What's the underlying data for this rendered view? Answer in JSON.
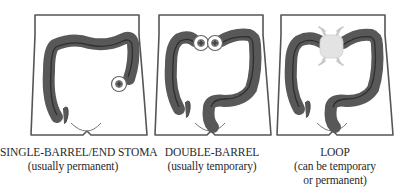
{
  "figure": {
    "panels": [
      {
        "id": "single-barrel",
        "title": "SINGLE-BARREL/END STOMA",
        "subtitle_lines": [
          "(usually permanent)"
        ],
        "stoma_count": 1
      },
      {
        "id": "double-barrel",
        "title": "DOUBLE-BARREL",
        "subtitle_lines": [
          "(usually temporary)"
        ],
        "stoma_count": 2
      },
      {
        "id": "loop",
        "title": "LOOP",
        "subtitle_lines": [
          "(can be temporary",
          "or permanent)"
        ],
        "stoma_count": 1
      }
    ],
    "colors": {
      "outline": "#555555",
      "colon_fill": "#555555",
      "colon_stripe": "#333333",
      "stoma_ring": "#666666",
      "stoma_center": "#777777",
      "loop_block": "#e3e3e3",
      "rod": "#c8c8c8",
      "text": "#2a2a2a"
    }
  }
}
